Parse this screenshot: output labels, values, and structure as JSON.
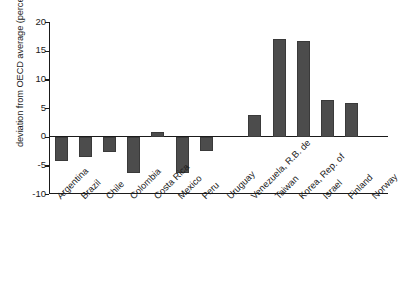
{
  "chart_data": {
    "type": "bar",
    "title": "",
    "subtitle": "",
    "xlabel": "",
    "ylabel": "deviation from OECD average (percent)",
    "ylim": [
      -10,
      20
    ],
    "yticks": [
      20,
      15,
      10,
      5,
      0,
      -5,
      -10
    ],
    "ytick_labels": [
      "20",
      "15",
      "10",
      "5",
      "0",
      "-5",
      "-10"
    ],
    "grid": false,
    "legend": "none",
    "bar_color": "#4c4c4c",
    "axis_color": "#1a1a1a",
    "background": "#ffffff",
    "categories": [
      "Argentina",
      "Brazil",
      "Chile",
      "Colombia",
      "Costa Rica",
      "Mexico",
      "Peru",
      "Uruguay",
      "Venezuela, R.B. de",
      "Taiwan",
      "Korea, Rep. of",
      "Israel",
      "Finland",
      "Norway"
    ],
    "values": [
      -4.3,
      -3.6,
      -2.7,
      -6.4,
      0.8,
      -6.3,
      -2.5,
      0,
      3.8,
      17.1,
      16.7,
      6.4,
      5.8,
      0
    ]
  }
}
